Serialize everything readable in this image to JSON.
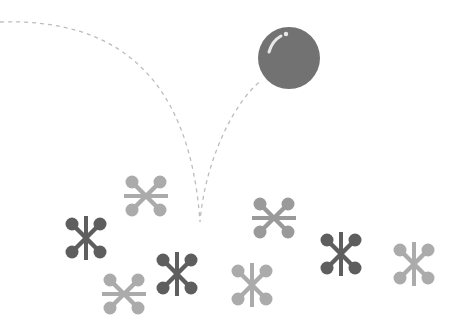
{
  "scene": {
    "description": "Grayscale illustration of a ball bouncing over scattered jacks",
    "background": "#ffffff"
  },
  "ball": {
    "cx": 289,
    "cy": 58,
    "r": 31,
    "fill": "#727272",
    "highlight": "#e8e8e8"
  },
  "trajectory": {
    "stroke": "#bdbdbd",
    "dash": "4 4",
    "path": "M 0 22 C 120 18, 190 80, 200 222 C 205 160, 235 100, 262 80"
  },
  "colors": {
    "dark": "#5e5e5e",
    "medium": "#9a9a9a",
    "light": "#ababab"
  },
  "jacks": [
    {
      "cx": 146,
      "cy": 196,
      "shade": "light",
      "bar": "horizontal"
    },
    {
      "cx": 86,
      "cy": 238,
      "shade": "dark",
      "bar": "vertical"
    },
    {
      "cx": 124,
      "cy": 294,
      "shade": "light",
      "bar": "horizontal"
    },
    {
      "cx": 177,
      "cy": 274,
      "shade": "dark",
      "bar": "vertical"
    },
    {
      "cx": 274,
      "cy": 218,
      "shade": "medium",
      "bar": "horizontal"
    },
    {
      "cx": 252,
      "cy": 285,
      "shade": "light",
      "bar": "vertical"
    },
    {
      "cx": 341,
      "cy": 254,
      "shade": "dark",
      "bar": "vertical"
    },
    {
      "cx": 414,
      "cy": 264,
      "shade": "light",
      "bar": "vertical"
    }
  ]
}
